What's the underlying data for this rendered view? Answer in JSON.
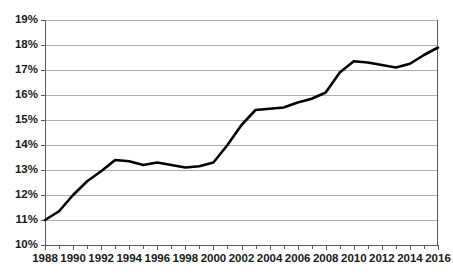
{
  "chart_data": {
    "type": "line",
    "title": "",
    "subtitle": "",
    "xlabel": "",
    "ylabel": "",
    "grid": "horizontal",
    "legend": "none",
    "xlim": [
      1988,
      2016
    ],
    "ylim": [
      10,
      19
    ],
    "y_tick_format": "percent",
    "y_ticks": [
      10,
      11,
      12,
      13,
      14,
      15,
      16,
      17,
      18,
      19
    ],
    "y_tick_labels": [
      "10%",
      "11%",
      "12%",
      "13%",
      "14%",
      "15%",
      "16%",
      "17%",
      "18%",
      "19%"
    ],
    "x_ticks": [
      1988,
      1989,
      1990,
      1991,
      1992,
      1993,
      1994,
      1995,
      1996,
      1997,
      1998,
      1999,
      2000,
      2001,
      2002,
      2003,
      2004,
      2005,
      2006,
      2007,
      2008,
      2009,
      2010,
      2011,
      2012,
      2013,
      2014,
      2015,
      2016
    ],
    "x_tick_labels_shown": [
      "1988",
      "1990",
      "1992",
      "1994",
      "1996",
      "1998",
      "2000",
      "2002",
      "2004",
      "2006",
      "2008",
      "2010",
      "2012",
      "2014",
      "2016"
    ],
    "x": [
      1988,
      1989,
      1990,
      1991,
      1992,
      1993,
      1994,
      1995,
      1996,
      1997,
      1998,
      1999,
      2000,
      2001,
      2002,
      2003,
      2004,
      2005,
      2006,
      2007,
      2008,
      2009,
      2010,
      2011,
      2012,
      2013,
      2014,
      2015,
      2016
    ],
    "values": [
      11.0,
      11.35,
      12.0,
      12.55,
      12.95,
      13.4,
      13.35,
      13.2,
      13.3,
      13.2,
      13.1,
      13.15,
      13.3,
      14.0,
      14.8,
      15.4,
      15.45,
      15.5,
      15.7,
      15.85,
      16.1,
      16.9,
      17.35,
      17.3,
      17.2,
      17.1,
      17.25,
      17.6,
      17.9
    ],
    "series_color": "#000000",
    "series_name": "",
    "gridline_color": "#9a9a9a",
    "axis_color": "#5a5a5a",
    "background": "#ffffff"
  }
}
